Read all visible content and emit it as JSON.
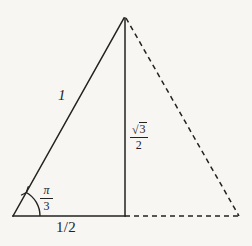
{
  "figure": {
    "background_color": "#f7f6f3",
    "ink_color": "#24221f",
    "width": 252,
    "height": 246
  },
  "geometry": {
    "vertices": {
      "left": {
        "name": "bottom-left-vertex",
        "x": 13,
        "y": 216
      },
      "apex": {
        "name": "apex-vertex",
        "x": 124,
        "y": 18
      },
      "foot": {
        "name": "altitude-foot",
        "x": 125,
        "y": 216
      },
      "right": {
        "name": "bottom-right-vertex",
        "x": 239,
        "y": 216
      }
    },
    "edges": [
      {
        "name": "hypotenuse",
        "style": "solid",
        "from": "left",
        "to": "apex",
        "label": "1"
      },
      {
        "name": "altitude",
        "style": "solid",
        "from": "apex",
        "to": "foot",
        "label": "sqrt3/2"
      },
      {
        "name": "base-half",
        "style": "solid",
        "from": "left",
        "to": "foot",
        "label": "1/2"
      },
      {
        "name": "mirror-hypotenuse",
        "style": "dashed",
        "from": "apex",
        "to": "right",
        "label": ""
      },
      {
        "name": "mirror-base-half",
        "style": "dashed",
        "from": "foot",
        "to": "right",
        "label": ""
      }
    ],
    "angle_arc": {
      "name": "interior-angle-arc",
      "at": "left",
      "radius": 27,
      "label": "pi/3"
    },
    "dash_pattern": "5 4",
    "stroke_width": 1.5
  },
  "labels": {
    "hypotenuse": {
      "name": "hypotenuse-length-label",
      "text": "1"
    },
    "base": {
      "name": "base-length-label",
      "text": "1/2"
    },
    "altitude": {
      "name": "altitude-length-label",
      "radical_sign": "√",
      "numerator_radicand": "3",
      "denominator": "2"
    },
    "angle": {
      "name": "interior-angle-label",
      "numerator": "π",
      "denominator": "3"
    }
  }
}
